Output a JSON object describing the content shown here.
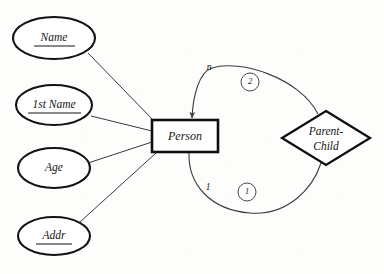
{
  "diagram": {
    "type": "entity-relationship-diagram",
    "entities": [
      {
        "id": "person",
        "label": "Person",
        "shape": "rectangle",
        "x": 152,
        "y": 120,
        "width": 66,
        "height": 32
      }
    ],
    "relationships": [
      {
        "id": "parent-child",
        "label_line1": "Parent-",
        "label_line2": "Child",
        "shape": "diamond",
        "cx": 326,
        "cy": 138,
        "rx": 44,
        "ry": 27
      }
    ],
    "attributes": [
      {
        "id": "name",
        "label": "Name",
        "key": true,
        "cx": 54,
        "cy": 38,
        "rx": 41,
        "ry": 21
      },
      {
        "id": "1st-name",
        "label": "1st Name",
        "key": true,
        "cx": 54,
        "cy": 105,
        "rx": 38,
        "ry": 20
      },
      {
        "id": "age",
        "label": "Age",
        "key": false,
        "cx": 54,
        "cy": 168,
        "rx": 36,
        "ry": 20
      },
      {
        "id": "addr",
        "label": "Addr",
        "key": true,
        "cx": 54,
        "cy": 236,
        "rx": 36,
        "ry": 19
      }
    ],
    "cardinalities": [
      {
        "id": "upper-arc-role",
        "label": "n",
        "x": 209,
        "y": 68,
        "arc": "upper"
      },
      {
        "id": "lower-arc-role",
        "label": "1",
        "x": 208,
        "y": 188,
        "arc": "lower"
      }
    ],
    "badges": [
      {
        "id": "badge-upper",
        "label": "2",
        "cx": 250,
        "cy": 82,
        "r": 9
      },
      {
        "id": "badge-lower",
        "label": "1",
        "cx": 247,
        "cy": 192,
        "r": 9
      }
    ],
    "arcs": [
      {
        "id": "arc-upper",
        "from": "parent-child",
        "to": "person",
        "arrowhead": true,
        "direction": "into-person"
      },
      {
        "id": "arc-lower",
        "from": "person",
        "to": "parent-child",
        "arrowhead": false,
        "direction": "plain"
      }
    ],
    "connectors": [
      {
        "from": "name",
        "to": "person"
      },
      {
        "from": "1st-name",
        "to": "person"
      },
      {
        "from": "age",
        "to": "person"
      },
      {
        "from": "addr",
        "to": "person"
      }
    ]
  },
  "colors": {
    "background": "#fdfdfc",
    "shape_stroke": "#0e0e0e",
    "connector_stroke": "#3a3a3a",
    "text": "#151515"
  }
}
